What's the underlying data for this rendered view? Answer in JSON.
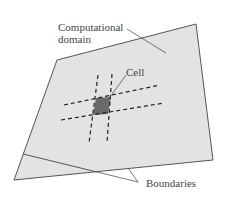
{
  "labels": {
    "domain_line1": "Computational",
    "domain_line2": "domain",
    "cell": "Cell",
    "boundaries": "Boundaries"
  },
  "colors": {
    "domain_fill": "#e3e3e3",
    "cell_fill": "#6a6a6a",
    "stroke": "#444444"
  }
}
